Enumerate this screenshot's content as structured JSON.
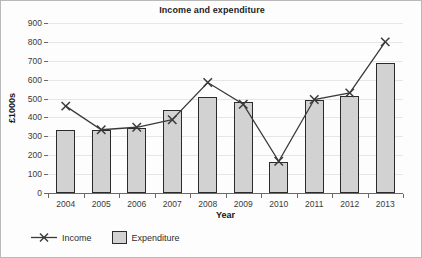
{
  "chart_data": {
    "type": "bar",
    "title": "Income and expenditure",
    "xlabel": "Year",
    "ylabel": "£1000s",
    "categories": [
      "2004",
      "2005",
      "2006",
      "2007",
      "2008",
      "2009",
      "2010",
      "2011",
      "2012",
      "2013"
    ],
    "ylim": [
      0,
      900
    ],
    "ytick_step": 100,
    "yticks": [
      0,
      100,
      200,
      300,
      400,
      500,
      600,
      700,
      800,
      900
    ],
    "ytick_labels": [
      "0",
      "100",
      "200",
      "300",
      "400",
      "500",
      "600",
      "700",
      "800",
      "900"
    ],
    "grid": true,
    "legend_position": "below",
    "series": [
      {
        "name": "Income",
        "type": "line",
        "marker": "x",
        "color": "#3a3a3a",
        "values": [
          460,
          335,
          348,
          388,
          585,
          470,
          168,
          495,
          530,
          800
        ]
      },
      {
        "name": "Expenditure",
        "type": "bar",
        "color": "#d2d2d2",
        "edge_color": "#2b2b2b",
        "values": [
          335,
          335,
          345,
          437,
          510,
          480,
          165,
          490,
          512,
          690
        ]
      }
    ]
  },
  "legend": {
    "income_label": "Income",
    "expenditure_label": "Expenditure"
  }
}
